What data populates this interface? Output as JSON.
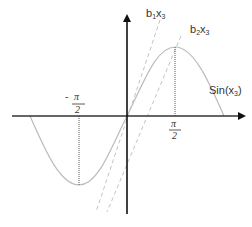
{
  "diagram": {
    "labels": {
      "curve": "Sin(x",
      "curve_sub": "3",
      "curve_close": ")",
      "line1_b": "b",
      "line1_b_sub": "1",
      "line1_x": "x",
      "line1_x_sub": "3",
      "line2_b": "b",
      "line2_b_sub": "2",
      "line2_x": "x",
      "line2_x_sub": "3",
      "neg_half_pi_sign": "-",
      "neg_half_pi_num": "π",
      "neg_half_pi_den": "2",
      "half_pi_num": "π",
      "half_pi_den": "2"
    },
    "colors": {
      "axis": "#111111",
      "curve": "#bbbbbb",
      "dashed": "#c4c4c4",
      "dotted_guide": "#555555",
      "text": "#333333"
    },
    "elements": [
      {
        "name": "x-axis",
        "type": "arrow"
      },
      {
        "name": "y-axis",
        "type": "arrow"
      },
      {
        "name": "sine-curve",
        "type": "curve",
        "label": "Sin(x3)"
      },
      {
        "name": "tangent-b1",
        "type": "dashed-line",
        "label": "b1x3"
      },
      {
        "name": "tangent-b2",
        "type": "dashed-line",
        "label": "b2x3"
      },
      {
        "name": "guide-neg-half-pi",
        "type": "dotted-vertical",
        "label": "-π/2"
      },
      {
        "name": "guide-half-pi",
        "type": "dotted-vertical",
        "label": "π/2"
      }
    ]
  }
}
